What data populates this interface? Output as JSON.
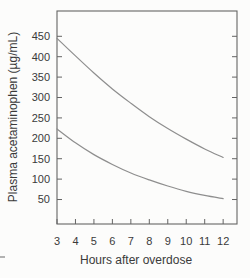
{
  "chart_data": {
    "type": "line",
    "title": "",
    "xlabel": "Hours after overdose",
    "ylabel": "Plasma acetaminophen (µg/mL)",
    "x": [
      3,
      4,
      5,
      6,
      7,
      8,
      9,
      10,
      11,
      12
    ],
    "x_ticks": [
      3,
      4,
      5,
      6,
      7,
      8,
      9,
      10,
      11,
      12
    ],
    "y_ticks": [
      50,
      100,
      150,
      200,
      250,
      300,
      350,
      400,
      450
    ],
    "xlim": [
      3,
      12.75
    ],
    "ylim": [
      -10,
      512
    ],
    "grid": false,
    "legend": "none",
    "series": [
      {
        "name": "upper curve",
        "values": [
          445,
          402,
          360,
          321,
          286,
          253,
          224,
          198,
          174,
          153
        ]
      },
      {
        "name": "lower curve",
        "values": [
          223,
          189,
          160,
          136,
          115,
          98,
          83,
          70,
          60,
          52
        ]
      }
    ],
    "colors": {
      "curve": "#8e8e8e",
      "axis": "#646464",
      "text": "#3a3a3a",
      "background": "#fcfcfb"
    }
  }
}
